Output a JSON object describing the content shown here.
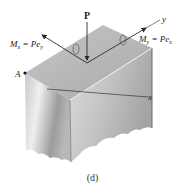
{
  "figure": {
    "caption": "(d)",
    "labels": {
      "force": "P",
      "axis_x": "x",
      "axis_y": "y",
      "point_a": "A",
      "moment_x": {
        "symbol": "M",
        "sub": "x",
        "eq": " = P",
        "var": "e",
        "var_sub": "y"
      },
      "moment_y": {
        "symbol": "M",
        "sub": "y",
        "eq": " = P",
        "var": "e",
        "var_sub": "x"
      }
    },
    "colors": {
      "top_face": "#b9b9b9",
      "left_face_light": "#e6e6e6",
      "left_face_dark": "#9a9a9a",
      "right_face_light": "#d4d4d4",
      "right_face_dark": "#a8a8a8",
      "arrow": "#2a2a2a"
    }
  }
}
